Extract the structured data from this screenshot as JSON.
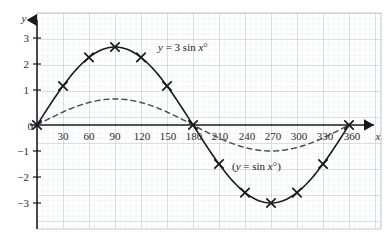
{
  "chart_data": {
    "type": "line",
    "title": "",
    "xlabel": "x",
    "ylabel": "y",
    "xlim": [
      -15,
      375
    ],
    "ylim": [
      -3.6,
      3.6
    ],
    "grid": true,
    "grid_minor_step_x": 6,
    "grid_major_step_x": 30,
    "grid_minor_step_y": 0.2,
    "grid_major_step_y": 1,
    "legend_position": "inline-annotation",
    "xticks": [
      30,
      60,
      90,
      120,
      150,
      180,
      210,
      240,
      270,
      300,
      330,
      360
    ],
    "xtick_labels": [
      "30",
      "60",
      "90",
      "120",
      "150",
      "180",
      "210",
      "240",
      "270",
      "300",
      "330",
      "360"
    ],
    "yticks": [
      3,
      2,
      1,
      0,
      -1,
      -2,
      -3
    ],
    "ytick_labels": [
      "3",
      "2",
      "1",
      "0",
      "−1",
      "−2",
      "−3"
    ],
    "series": [
      {
        "name": "y = 3 sin x°",
        "style": "solid",
        "marker": "x-cross",
        "color": "#1a1a1a",
        "x": [
          0,
          30,
          60,
          90,
          120,
          150,
          180,
          210,
          240,
          270,
          300,
          330,
          360
        ],
        "values": [
          0,
          1.5,
          2.6,
          3,
          2.6,
          1.5,
          0,
          -1.5,
          -2.6,
          -3,
          -2.6,
          -1.5,
          0
        ]
      },
      {
        "name": "(y = sin x°)",
        "style": "dashed",
        "marker": "none",
        "color": "#4a4a4a",
        "x": [
          0,
          30,
          60,
          90,
          120,
          150,
          180,
          210,
          240,
          270,
          300,
          330,
          360
        ],
        "values": [
          0,
          0.5,
          0.87,
          1,
          0.87,
          0.5,
          0,
          -0.5,
          -0.87,
          -1,
          -0.87,
          -0.5,
          0
        ]
      }
    ],
    "annotations": [
      {
        "id": "label-3sin",
        "text_parts": {
          "y": "y",
          "eq": " = 3 sin ",
          "x": "x",
          "deg": "°"
        },
        "full_text": "y = 3 sin x°",
        "x_px": 158,
        "y_px": 51
      },
      {
        "id": "label-sin",
        "text_parts": {
          "open": "(",
          "y": "y",
          "eq": " = sin ",
          "x": "x",
          "deg": "°)"
        },
        "full_text": "(y = sin x°)",
        "x_px": 232,
        "y_px": 170
      }
    ],
    "colors": {
      "grid_minor": "#dfe3ea",
      "grid_major": "#b9bfc9",
      "axis": "#1a1a1a",
      "curve_primary": "#1a1a1a",
      "curve_secondary": "#4a4a4a",
      "text": "#2b2b2b",
      "background": "#ffffff"
    }
  },
  "axes": {
    "y_axis_label": "y",
    "x_axis_label": "x"
  }
}
